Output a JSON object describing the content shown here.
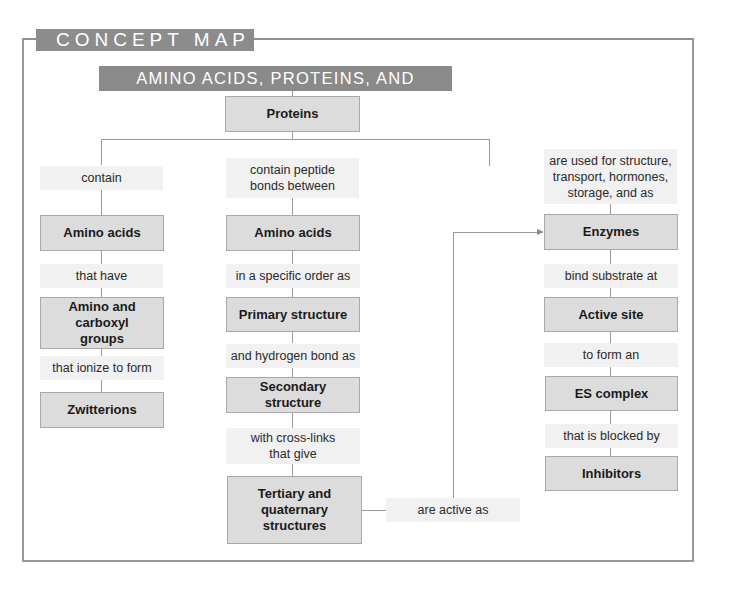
{
  "header": {
    "tab_label": "CONCEPT MAP",
    "title": "AMINO ACIDS, PROTEINS, AND ENZYMES"
  },
  "root": {
    "label": "Proteins"
  },
  "left_column": {
    "link1": "contain",
    "node1": "Amino acids",
    "link2": "that have",
    "node2": "Amino and carboxyl groups",
    "link3": "that ionize to form",
    "node3": "Zwitterions"
  },
  "middle_column": {
    "link1": "contain peptide bonds between",
    "node1": "Amino acids",
    "link2": "in a specific order as",
    "node2": "Primary structure",
    "link3": "and hydrogen bond as",
    "node3": "Secondary structure",
    "link4": "with cross-links that give",
    "node4": "Tertiary and quaternary structures",
    "cross_link": "are active as"
  },
  "right_column": {
    "link1": "are used for structure, transport, hormones, storage, and as",
    "node1": "Enzymes",
    "link2": "bind substrate at",
    "node2": "Active site",
    "link3": "to form an",
    "node3": "ES complex",
    "link4": "that is blocked by",
    "node4": "Inhibitors"
  },
  "colors": {
    "header_bg": "#8c8c8c",
    "node_bg": "#dcdcdc",
    "link_bg": "#f1f1f1",
    "line": "#9a9a9a"
  }
}
